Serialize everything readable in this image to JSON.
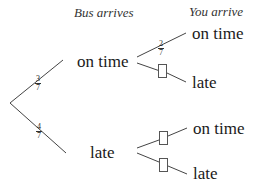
{
  "headers": {
    "stage1": "Bus arrives",
    "stage2": "You arrive"
  },
  "stage1": {
    "branches": [
      {
        "label": "on time",
        "probability": {
          "num": "3",
          "den": "7"
        }
      },
      {
        "label": "late",
        "probability": {
          "num": "4",
          "den": "7"
        }
      }
    ]
  },
  "stage2": {
    "after_on_time": [
      {
        "label": "on time",
        "probability": {
          "num": "2",
          "den": "7"
        },
        "blank": false
      },
      {
        "label": "late",
        "probability": null,
        "blank": true
      }
    ],
    "after_late": [
      {
        "label": "on time",
        "probability": null,
        "blank": true
      },
      {
        "label": "late",
        "probability": null,
        "blank": true
      }
    ]
  },
  "colors": {
    "line": "#444444",
    "text": "#1a1a1a"
  }
}
